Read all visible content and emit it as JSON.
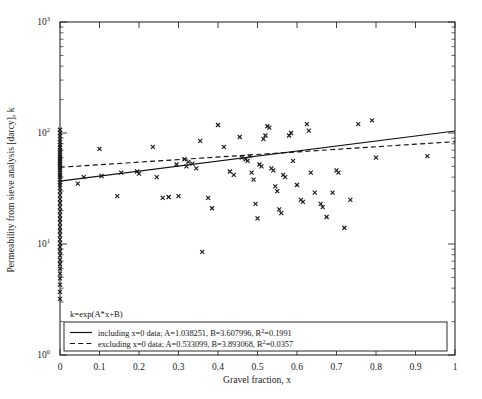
{
  "chart_data": {
    "type": "scatter",
    "title": "",
    "xlabel": "Gravel fraction, x",
    "ylabel": "Permeability from sieve analysis [darcy], k",
    "xlim": [
      0,
      1
    ],
    "ylim": [
      1,
      1000
    ],
    "yscale": "log",
    "xscale": "linear",
    "grid": false,
    "xticks": [
      "0",
      "0.1",
      "0.2",
      "0.3",
      "0.4",
      "0.5",
      "0.6",
      "0.7",
      "0.8",
      "0.9",
      "1"
    ],
    "xtick_values": [
      0,
      0.1,
      0.2,
      0.3,
      0.4,
      0.5,
      0.6,
      0.7,
      0.8,
      0.9,
      1
    ],
    "ytick_labels": [
      "10",
      "10",
      "10",
      "10"
    ],
    "ytick_exponents": [
      "0",
      "1",
      "2",
      "3"
    ],
    "ytick_values": [
      1,
      10,
      100,
      1000
    ],
    "annotation": "k=exp(A*x+B)",
    "legend_position": "lower-left",
    "marker_symbol": "x-cross",
    "series": [
      {
        "name": "sieve analysis data",
        "type": "scatter",
        "points": [
          [
            0,
            3.2
          ],
          [
            0,
            3.7
          ],
          [
            0,
            4.3
          ],
          [
            0,
            4.9
          ],
          [
            0,
            5.4
          ],
          [
            0,
            6.0
          ],
          [
            0,
            6.6
          ],
          [
            0,
            7.2
          ],
          [
            0,
            7.9
          ],
          [
            0,
            8.6
          ],
          [
            0,
            9.4
          ],
          [
            0,
            10.2
          ],
          [
            0,
            11.0
          ],
          [
            0,
            12.0
          ],
          [
            0,
            13.1
          ],
          [
            0,
            14.2
          ],
          [
            0,
            15.5
          ],
          [
            0,
            16.8
          ],
          [
            0,
            18.2
          ],
          [
            0,
            19.8
          ],
          [
            0,
            21.5
          ],
          [
            0,
            23.4
          ],
          [
            0,
            25.4
          ],
          [
            0,
            27.6
          ],
          [
            0,
            30.0
          ],
          [
            0,
            32.0
          ],
          [
            0,
            34.0
          ],
          [
            0,
            36.0
          ],
          [
            0,
            38.0
          ],
          [
            0,
            40.0
          ],
          [
            0,
            42.0
          ],
          [
            0,
            44.0
          ],
          [
            0,
            46.0
          ],
          [
            0,
            48.0
          ],
          [
            0,
            50.0
          ],
          [
            0,
            52.0
          ],
          [
            0,
            54.0
          ],
          [
            0,
            56.0
          ],
          [
            0,
            58.5
          ],
          [
            0,
            61.0
          ],
          [
            0,
            64.0
          ],
          [
            0,
            67.0
          ],
          [
            0,
            70.0
          ],
          [
            0,
            74.0
          ],
          [
            0,
            78.0
          ],
          [
            0,
            83.0
          ],
          [
            0,
            88.0
          ],
          [
            0,
            94.0
          ],
          [
            0,
            100.0
          ],
          [
            0,
            107.0
          ],
          [
            0.045,
            35.0
          ],
          [
            0.06,
            40.0
          ],
          [
            0.1,
            72.0
          ],
          [
            0.105,
            41.0
          ],
          [
            0.145,
            27.0
          ],
          [
            0.155,
            44.0
          ],
          [
            0.195,
            45.0
          ],
          [
            0.2,
            43.0
          ],
          [
            0.235,
            75.0
          ],
          [
            0.245,
            40.0
          ],
          [
            0.26,
            26.0
          ],
          [
            0.275,
            26.5
          ],
          [
            0.295,
            52.0
          ],
          [
            0.3,
            27.0
          ],
          [
            0.315,
            58.0
          ],
          [
            0.32,
            50.0
          ],
          [
            0.325,
            55.0
          ],
          [
            0.335,
            53.0
          ],
          [
            0.345,
            48.0
          ],
          [
            0.355,
            85.0
          ],
          [
            0.36,
            8.5
          ],
          [
            0.375,
            26.0
          ],
          [
            0.385,
            21.0
          ],
          [
            0.4,
            118.0
          ],
          [
            0.415,
            75.0
          ],
          [
            0.43,
            45.0
          ],
          [
            0.44,
            42.0
          ],
          [
            0.455,
            92.0
          ],
          [
            0.46,
            60.0
          ],
          [
            0.47,
            58.0
          ],
          [
            0.475,
            56.0
          ],
          [
            0.48,
            62.0
          ],
          [
            0.485,
            44.0
          ],
          [
            0.49,
            38.0
          ],
          [
            0.495,
            23.0
          ],
          [
            0.5,
            17.0
          ],
          [
            0.505,
            52.0
          ],
          [
            0.51,
            50.0
          ],
          [
            0.515,
            88.0
          ],
          [
            0.52,
            95.0
          ],
          [
            0.525,
            115.0
          ],
          [
            0.53,
            112.0
          ],
          [
            0.535,
            48.0
          ],
          [
            0.54,
            46.0
          ],
          [
            0.545,
            33.0
          ],
          [
            0.55,
            30.0
          ],
          [
            0.555,
            20.5
          ],
          [
            0.56,
            19.0
          ],
          [
            0.565,
            42.0
          ],
          [
            0.57,
            40.0
          ],
          [
            0.58,
            95.0
          ],
          [
            0.585,
            100.0
          ],
          [
            0.59,
            56.0
          ],
          [
            0.6,
            34.0
          ],
          [
            0.61,
            25.0
          ],
          [
            0.615,
            24.0
          ],
          [
            0.625,
            120.0
          ],
          [
            0.63,
            105.0
          ],
          [
            0.635,
            44.0
          ],
          [
            0.645,
            29.0
          ],
          [
            0.66,
            23.0
          ],
          [
            0.665,
            21.5
          ],
          [
            0.675,
            17.5
          ],
          [
            0.69,
            29.0
          ],
          [
            0.7,
            46.0
          ],
          [
            0.705,
            44.0
          ],
          [
            0.72,
            14.0
          ],
          [
            0.735,
            25.0
          ],
          [
            0.755,
            120.0
          ],
          [
            0.79,
            130.0
          ],
          [
            0.8,
            60.0
          ],
          [
            0.93,
            62.0
          ]
        ]
      },
      {
        "name": "including x=0 data; A=1.038251, B=3.607996, R²=0.1991",
        "type": "line",
        "style": "solid",
        "A": 1.038251,
        "B": 3.607996,
        "R2": 0.1991,
        "endpoints": [
          [
            0,
            36.9
          ],
          [
            1,
            104.3
          ]
        ]
      },
      {
        "name": "excluding x=0 data; A=0.533099, B=3.893068, R²=0.0357",
        "type": "line",
        "style": "dashed",
        "A": 0.533099,
        "B": 3.893068,
        "R2": 0.0357,
        "endpoints": [
          [
            0,
            49.1
          ],
          [
            1,
            83.6
          ]
        ]
      }
    ]
  },
  "legend": {
    "entries": [
      {
        "style": "solid",
        "text": "including x=0 data; A=1.038251, B=3.607996, R",
        "sup": "2",
        "tail": "=0.1991"
      },
      {
        "style": "dashed",
        "text": "excluding x=0 data; A=0.533099, B=3.893068, R",
        "sup": "2",
        "tail": "=0.0357"
      }
    ]
  },
  "annotation": {
    "equation": "k=exp(A*x+B)"
  },
  "axes": {
    "xlabel": "Gravel fraction, x",
    "ylabel": "Permeability from sieve analysis [darcy], k"
  }
}
